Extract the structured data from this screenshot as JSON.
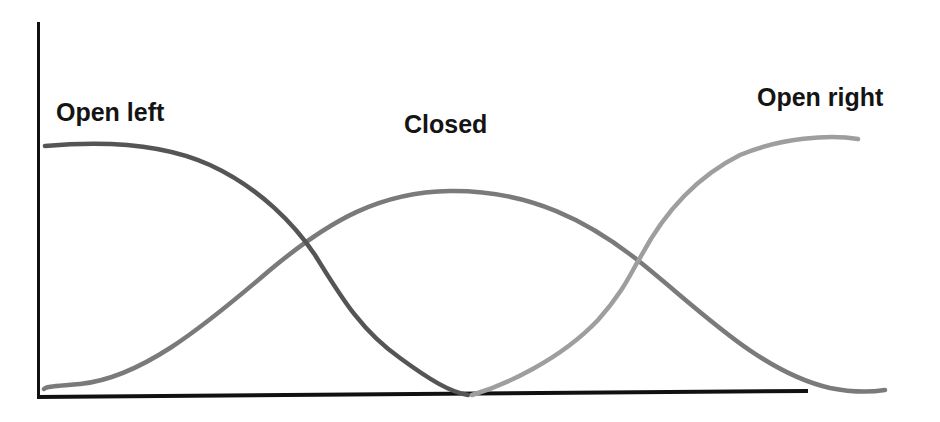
{
  "diagram": {
    "type": "state-curves",
    "labels": {
      "open_left": "Open left",
      "closed": "Closed",
      "open_right": "Open right"
    },
    "colors": {
      "axis": "#111111",
      "open_left_curve": "#555555",
      "closed_curve": "#7a7a7a",
      "open_right_curve": "#9e9e9e",
      "label_text": "#141414",
      "background": "#ffffff"
    },
    "curves": [
      {
        "name": "Open left",
        "shape": "descending sigmoid",
        "start_level": "high",
        "end_level": "zero",
        "crosses_zero_at": "middle"
      },
      {
        "name": "Closed",
        "shape": "bell",
        "peak_position": "middle",
        "peak_level": "medium-high"
      },
      {
        "name": "Open right",
        "shape": "ascending sigmoid",
        "start_level": "zero",
        "start_position": "middle",
        "end_level": "high"
      }
    ],
    "axes": {
      "x_axis": "horizontal baseline, unlabeled",
      "y_axis": "vertical axis, unlabeled"
    }
  }
}
